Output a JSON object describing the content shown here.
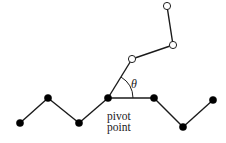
{
  "diagram": {
    "type": "polymer-chain-pivot-move",
    "colors": {
      "line": "#1a1a1a",
      "fixed_monomer": "#000000",
      "rotated_monomer_fill": "#ffffff"
    },
    "fixed_chain": [
      {
        "x": 20,
        "y": 123
      },
      {
        "x": 48,
        "y": 98
      },
      {
        "x": 79,
        "y": 123
      },
      {
        "x": 108,
        "y": 98
      },
      {
        "x": 154,
        "y": 98
      },
      {
        "x": 183,
        "y": 127
      },
      {
        "x": 213,
        "y": 100
      }
    ],
    "rotated_chain": [
      {
        "x": 108,
        "y": 98
      },
      {
        "x": 132,
        "y": 59
      },
      {
        "x": 173,
        "y": 45
      },
      {
        "x": 167,
        "y": 6
      }
    ],
    "pivot": {
      "x": 108,
      "y": 98
    },
    "angle_label": "θ",
    "pivot_label_line1": "pivot",
    "pivot_label_line2": "point"
  }
}
